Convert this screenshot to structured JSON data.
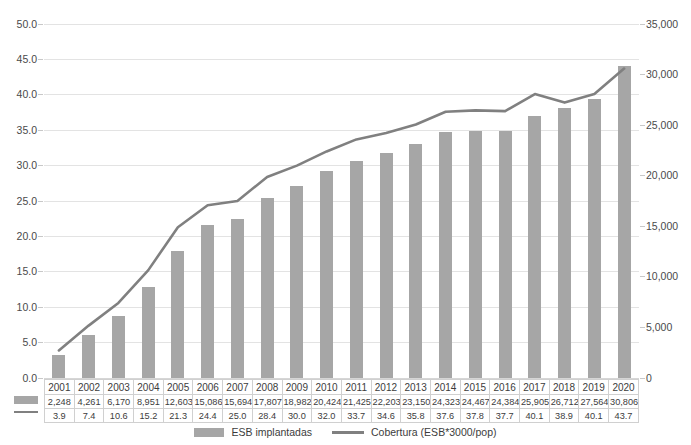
{
  "chart_data": {
    "type": "bar",
    "title": "",
    "subtitle": "",
    "xlabel": "",
    "categories": [
      "2001",
      "2002",
      "2003",
      "2004",
      "2005",
      "2006",
      "2007",
      "2008",
      "2009",
      "2010",
      "2011",
      "2012",
      "2013",
      "2014",
      "2015",
      "2016",
      "2017",
      "2018",
      "2019",
      "2020"
    ],
    "grid": true,
    "legend_position": "bottom",
    "series": [
      {
        "name": "ESB implantadas",
        "type": "bar",
        "axis": "right",
        "color": "#a6a6a6",
        "values": [
          2248,
          4261,
          6170,
          8951,
          12603,
          15086,
          15694,
          17807,
          18982,
          20424,
          21425,
          22203,
          23150,
          24323,
          24467,
          24384,
          25905,
          26712,
          27564,
          30806
        ],
        "value_labels": [
          "2,248",
          "4,261",
          "6,170",
          "8,951",
          "12,603",
          "15,086",
          "15,694",
          "17,807",
          "18,982",
          "20,424",
          "21,425",
          "22,203",
          "23,150",
          "24,323",
          "24,467",
          "24,384",
          "25,905",
          "26,712",
          "27,564",
          "30,806"
        ]
      },
      {
        "name": "Cobertura (ESB*3000/pop)",
        "type": "line",
        "axis": "left",
        "color": "#808080",
        "values": [
          3.9,
          7.4,
          10.6,
          15.2,
          21.3,
          24.4,
          25.0,
          28.4,
          30.0,
          32.0,
          33.7,
          34.6,
          35.8,
          37.6,
          37.8,
          37.7,
          40.1,
          38.9,
          40.1,
          43.7
        ],
        "value_labels": [
          "3.9",
          "7.4",
          "10.6",
          "15.2",
          "21.3",
          "24.4",
          "25.0",
          "28.4",
          "30.0",
          "32.0",
          "33.7",
          "34.6",
          "35.8",
          "37.6",
          "37.8",
          "37.7",
          "40.1",
          "38.9",
          "40.1",
          "43.7"
        ]
      }
    ],
    "left_axis": {
      "label": "",
      "ylim": [
        0,
        50
      ],
      "step": 5,
      "tick_labels": [
        "0.0",
        "5.0",
        "10.0",
        "15.0",
        "20.0",
        "25.0",
        "30.0",
        "35.0",
        "40.0",
        "45.0",
        "50.0"
      ]
    },
    "right_axis": {
      "label": "",
      "ylim": [
        0,
        35000
      ],
      "step": 5000,
      "tick_labels": [
        "0",
        "5,000",
        "10,000",
        "15,000",
        "20,000",
        "25,000",
        "30,000",
        "35,000"
      ]
    }
  },
  "legend": {
    "entries": [
      {
        "label": "ESB implantadas",
        "marker": "bar-swatch-icon"
      },
      {
        "label": "Cobertura (ESB*3000/pop)",
        "marker": "line-swatch-icon"
      }
    ]
  }
}
